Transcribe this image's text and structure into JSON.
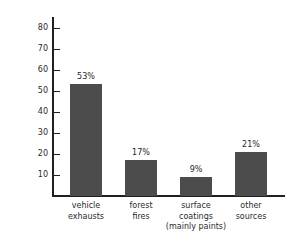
{
  "chart_data": {
    "type": "bar",
    "title": "",
    "xlabel": "",
    "ylabel": "percentage (%)",
    "categories": [
      "vehicle exhausts",
      "forest fires",
      "surface coatings (mainly paints)",
      "other sources"
    ],
    "category_lines": [
      [
        "vehicle",
        "exhausts"
      ],
      [
        "forest",
        "fires"
      ],
      [
        "surface",
        "coatings",
        "(mainly paints)"
      ],
      [
        "other",
        "sources"
      ]
    ],
    "values": [
      53,
      17,
      9,
      21
    ],
    "data_labels": [
      "53%",
      "17%",
      "9%",
      "21%"
    ],
    "ylim": [
      0,
      85
    ],
    "yticks": [
      10,
      20,
      30,
      40,
      50,
      60,
      70,
      80
    ],
    "ytick_labels": [
      "10",
      "20",
      "30",
      "40",
      "50",
      "60",
      "70",
      "80"
    ],
    "grid": false,
    "legend": null,
    "bar_color": "#4c4c4c",
    "axis_color": "#202020"
  }
}
